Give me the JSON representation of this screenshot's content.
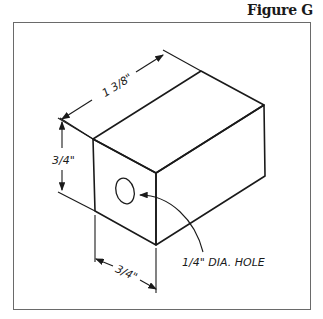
{
  "figure": {
    "title": "Figure G"
  },
  "dimensions": {
    "length": "1 3/8\"",
    "height": "3/4\"",
    "width": "3/4\""
  },
  "annotations": {
    "hole": "1/4\" DIA. HOLE"
  },
  "colors": {
    "line": "#1a1a1a",
    "frame": "#6a6a6a",
    "background": "#ffffff"
  }
}
